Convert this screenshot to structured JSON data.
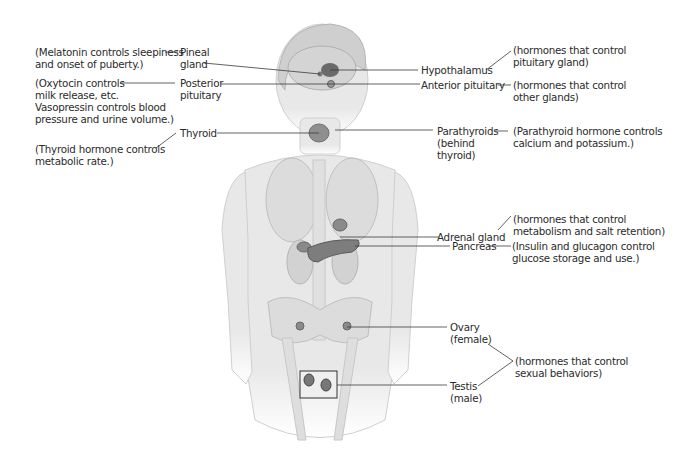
{
  "diagram": {
    "type": "anatomy-labeled-illustration",
    "colors": {
      "body": "#e6e6e6",
      "body_stroke": "#c8c8c8",
      "organ": "#9a9a9a",
      "gland": "#6e6e6e",
      "line": "#3a3a3a",
      "text": "#2b2b2b"
    },
    "glands": [
      {
        "id": "pineal",
        "name": [
          "Pineal",
          "gland"
        ],
        "description": [
          "(Melatonin controls sleepiness",
          "and onset of puberty.)"
        ]
      },
      {
        "id": "posterior-pituitary",
        "name": [
          "Posterior",
          "pituitary"
        ],
        "description": [
          "(Oxytocin controls",
          "milk release, etc.",
          "Vasopressin controls blood",
          "pressure and urine volume.)"
        ]
      },
      {
        "id": "thyroid",
        "name": [
          "Thyroid"
        ],
        "description": [
          "(Thyroid hormone controls",
          "metabolic rate.)"
        ]
      },
      {
        "id": "hypothalamus",
        "name": [
          "Hypothalamus"
        ],
        "description": [
          "(hormones that control",
          "pituitary gland)"
        ]
      },
      {
        "id": "anterior-pituitary",
        "name": [
          "Anterior pituitary"
        ],
        "description": [
          "(hormones that control",
          "other glands)"
        ]
      },
      {
        "id": "parathyroids",
        "name": [
          "Parathyroids",
          "(behind",
          "thyroid)"
        ],
        "description": [
          "(Parathyroid hormone controls",
          "calcium and potassium.)"
        ]
      },
      {
        "id": "adrenal",
        "name": [
          "Adrenal gland"
        ],
        "description": [
          "(hormones that control",
          "metabolism and salt retention)"
        ]
      },
      {
        "id": "pancreas",
        "name": [
          "Pancreas"
        ],
        "description": [
          "(Insulin and glucagon control",
          "glucose storage and use.)"
        ]
      },
      {
        "id": "ovary",
        "name": [
          "Ovary",
          "(female)"
        ],
        "description": []
      },
      {
        "id": "testis",
        "name": [
          "Testis",
          "(male)"
        ],
        "description": []
      }
    ],
    "shared_descriptions": {
      "sexual": [
        "(hormones that control",
        "sexual behaviors)"
      ]
    }
  }
}
